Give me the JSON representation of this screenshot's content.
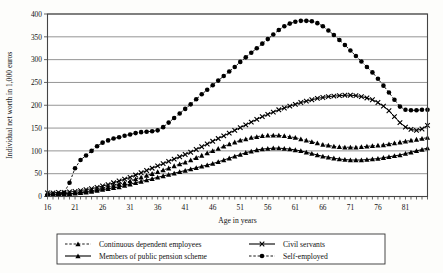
{
  "chart_data": {
    "type": "line",
    "title": "",
    "xlabel": "Age in years",
    "ylabel": "Individual net worth in 1,000 euros",
    "xlim": [
      16,
      85
    ],
    "ylim": [
      0,
      400
    ],
    "ytick_step": 50,
    "xtick_step": 5,
    "grid": true,
    "legend_position": "bottom",
    "yticks": [
      0,
      50,
      100,
      150,
      200,
      250,
      300,
      350,
      400
    ],
    "xticks": [
      16,
      21,
      26,
      31,
      36,
      41,
      46,
      51,
      56,
      61,
      66,
      71,
      76,
      81
    ],
    "x": [
      16,
      17,
      18,
      19,
      20,
      21,
      22,
      23,
      24,
      25,
      26,
      27,
      28,
      29,
      30,
      31,
      32,
      33,
      34,
      35,
      36,
      37,
      38,
      39,
      40,
      41,
      42,
      43,
      44,
      45,
      46,
      47,
      48,
      49,
      50,
      51,
      52,
      53,
      54,
      55,
      56,
      57,
      58,
      59,
      60,
      61,
      62,
      63,
      64,
      65,
      66,
      67,
      68,
      69,
      70,
      71,
      72,
      73,
      74,
      75,
      76,
      77,
      78,
      79,
      80,
      81,
      82,
      83,
      84,
      85
    ],
    "series": [
      {
        "name": "Continuous dependent employees",
        "marker": "triangle",
        "line": "dashed",
        "values": [
          6,
          6,
          6,
          6,
          7,
          8,
          9,
          11,
          13,
          15,
          18,
          21,
          24,
          27,
          30,
          34,
          38,
          42,
          46,
          50,
          54,
          58,
          62,
          67,
          71,
          75,
          80,
          85,
          90,
          95,
          100,
          105,
          110,
          115,
          119,
          123,
          126,
          129,
          131,
          133,
          134,
          134,
          134,
          133,
          131,
          129,
          126,
          123,
          120,
          117,
          114,
          112,
          110,
          109,
          108,
          108,
          108,
          109,
          110,
          111,
          112,
          113,
          115,
          117,
          119,
          121,
          123,
          125,
          127,
          129
        ]
      },
      {
        "name": "Members of public pension scheme",
        "marker": "triangle",
        "line": "solid",
        "values": [
          5,
          5,
          5,
          5,
          6,
          7,
          8,
          9,
          11,
          13,
          15,
          17,
          19,
          21,
          24,
          27,
          30,
          33,
          36,
          39,
          42,
          45,
          48,
          51,
          54,
          57,
          60,
          63,
          66,
          69,
          72,
          76,
          80,
          84,
          88,
          92,
          96,
          99,
          102,
          104,
          105,
          106,
          106,
          105,
          104,
          102,
          100,
          97,
          94,
          91,
          88,
          86,
          84,
          82,
          81,
          80,
          80,
          80,
          81,
          82,
          83,
          85,
          87,
          89,
          91,
          94,
          97,
          100,
          103,
          106
        ]
      },
      {
        "name": "Civil servants",
        "marker": "x",
        "line": "solid",
        "values": [
          8,
          8,
          9,
          9,
          10,
          11,
          13,
          15,
          17,
          20,
          23,
          26,
          30,
          34,
          38,
          42,
          47,
          52,
          57,
          62,
          67,
          72,
          77,
          82,
          87,
          92,
          97,
          103,
          109,
          115,
          121,
          127,
          133,
          139,
          145,
          151,
          157,
          163,
          169,
          175,
          180,
          185,
          190,
          194,
          198,
          202,
          206,
          209,
          212,
          215,
          217,
          219,
          220,
          221,
          222,
          222,
          221,
          219,
          216,
          212,
          206,
          198,
          188,
          175,
          162,
          152,
          147,
          145,
          148,
          156
        ]
      },
      {
        "name": "Self-employed",
        "marker": "circle",
        "line": "dashed",
        "values": [
          4,
          4,
          5,
          8,
          30,
          62,
          80,
          90,
          100,
          110,
          118,
          123,
          127,
          130,
          133,
          136,
          139,
          141,
          142,
          143,
          145,
          152,
          162,
          172,
          182,
          192,
          202,
          213,
          224,
          234,
          244,
          254,
          264,
          274,
          284,
          295,
          305,
          315,
          325,
          335,
          345,
          355,
          365,
          373,
          379,
          383,
          385,
          385,
          384,
          380,
          373,
          364,
          354,
          343,
          332,
          320,
          308,
          296,
          284,
          272,
          258,
          243,
          228,
          212,
          197,
          190,
          189,
          189,
          190,
          190
        ]
      }
    ]
  },
  "legend": {
    "entries": [
      {
        "label": "Continuous dependent employees",
        "marker": "triangle",
        "line": "dashed"
      },
      {
        "label": "Civil servants",
        "marker": "x",
        "line": "solid"
      },
      {
        "label": "Members of public pension scheme",
        "marker": "triangle",
        "line": "solid"
      },
      {
        "label": "Self-employed",
        "marker": "circle",
        "line": "dashed"
      }
    ]
  },
  "colors": {
    "series": "#000000",
    "grid": "#7a7a7a",
    "axis": "#555555",
    "background": "#fdfdfb"
  }
}
